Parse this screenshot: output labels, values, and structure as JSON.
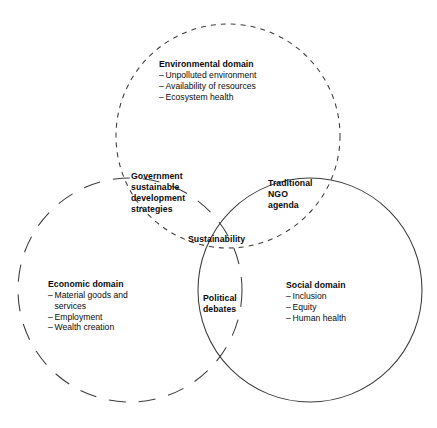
{
  "figure": {
    "type": "venn-diagram",
    "background_color": "#ffffff",
    "stroke_color": "#3c3c3c",
    "text_color": "#0a0a0a"
  },
  "circles": [
    {
      "id": "environmental",
      "name": "Environmental domain",
      "cx": 228,
      "cy": 136,
      "r": 112,
      "stroke_style": "dashed",
      "dash_pattern": "5 5"
    },
    {
      "id": "economic",
      "name": "Economic domain",
      "cx": 130,
      "cy": 290,
      "r": 112,
      "stroke_style": "dashed",
      "dash_pattern": "17 13"
    },
    {
      "id": "social",
      "name": "Social domain",
      "cx": 310,
      "cy": 290,
      "r": 112,
      "stroke_style": "solid",
      "dash_pattern": ""
    }
  ],
  "domains": {
    "environmental": {
      "title": "Environmental domain",
      "items": [
        "Unpolluted environment",
        "Availability of resources",
        "Ecosystem health"
      ]
    },
    "economic": {
      "title": "Economic  domain",
      "items": [
        "Material goods and",
        "services",
        "Employment",
        "Wealth creation"
      ],
      "item_is_continuation": [
        false,
        true,
        false,
        false
      ]
    },
    "social": {
      "title": "Social domain",
      "items": [
        "Inclusion",
        "Equity",
        "Human health"
      ]
    }
  },
  "overlaps": {
    "government": {
      "name": "Government sustainable development strategies",
      "lines": [
        "Government",
        "sustainable",
        "development",
        "strategies"
      ]
    },
    "ngo": {
      "name": "Traditional NGO agenda",
      "lines": [
        "Traditional",
        "NGO",
        "agenda"
      ]
    },
    "political": {
      "name": "Political debates",
      "lines": [
        "Political",
        "debates"
      ]
    },
    "sustainability": {
      "name": "Sustainability",
      "lines": [
        "Sustainability"
      ]
    }
  },
  "bullet_dash": "–"
}
